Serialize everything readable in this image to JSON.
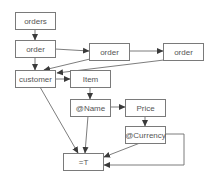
{
  "diagram": {
    "type": "flow-graph",
    "colors": {
      "node_border": "#7a7a7a",
      "edge": "#6e6e6e",
      "text": "#555555",
      "background": "#ffffff"
    },
    "nodes": [
      {
        "id": "orders",
        "label": "orders"
      },
      {
        "id": "order1",
        "label": "order"
      },
      {
        "id": "order2",
        "label": "order"
      },
      {
        "id": "order3",
        "label": "order"
      },
      {
        "id": "customer",
        "label": "customer"
      },
      {
        "id": "item",
        "label": "Item"
      },
      {
        "id": "name",
        "label": "@Name"
      },
      {
        "id": "price",
        "label": "Price"
      },
      {
        "id": "currency",
        "label": "@Currency"
      },
      {
        "id": "eqT",
        "label": "=T"
      }
    ],
    "edges": [
      {
        "from": "orders",
        "to": "order1"
      },
      {
        "from": "order1",
        "to": "order2"
      },
      {
        "from": "order2",
        "to": "order3"
      },
      {
        "from": "order1",
        "to": "customer"
      },
      {
        "from": "order2",
        "to": "customer"
      },
      {
        "from": "order3",
        "to": "customer"
      },
      {
        "from": "customer",
        "to": "item"
      },
      {
        "from": "item",
        "to": "name"
      },
      {
        "from": "name",
        "to": "price"
      },
      {
        "from": "price",
        "to": "currency"
      },
      {
        "from": "customer",
        "to": "eqT"
      },
      {
        "from": "name",
        "to": "eqT"
      },
      {
        "from": "currency",
        "to": "eqT"
      },
      {
        "from": "currency",
        "to": "eqT",
        "route": "loop-right"
      }
    ]
  }
}
